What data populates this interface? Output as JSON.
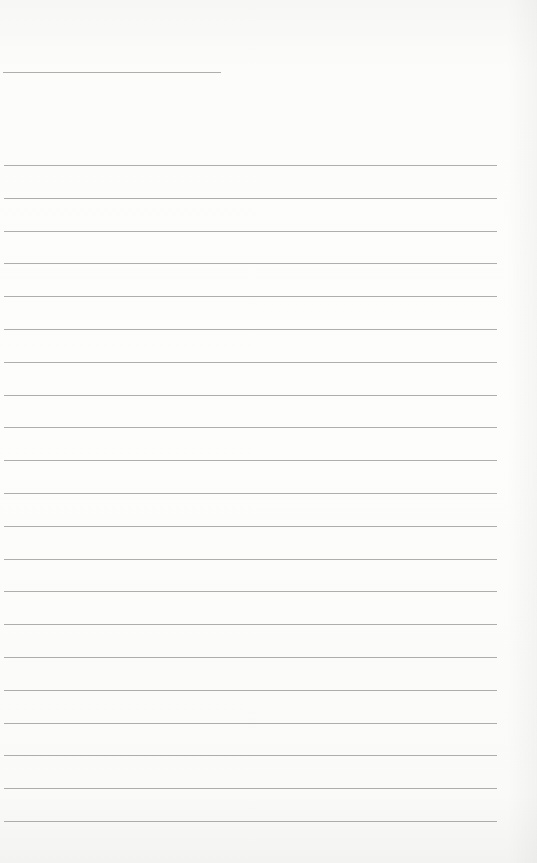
{
  "page": {
    "type": "lined-paper",
    "background": "#fbfbfa",
    "line_color": "#9a9a9a",
    "header_line": {
      "x": 3,
      "y": 72,
      "width": 218
    },
    "ruled_lines": {
      "count": 21,
      "x_start": 4,
      "x_end": 497,
      "first_y": 165,
      "spacing": 32.8
    }
  }
}
